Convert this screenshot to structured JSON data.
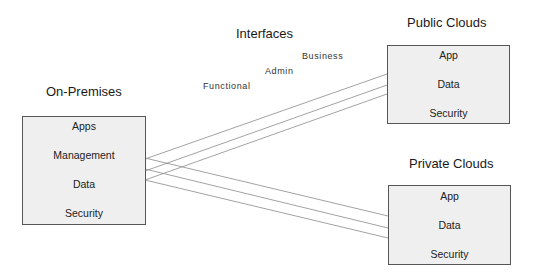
{
  "diagram": {
    "interfaces": {
      "title": "Interfaces",
      "types": [
        "Functional",
        "Admin",
        "Business"
      ]
    },
    "on_premises": {
      "title": "On-Premises",
      "items": [
        "Apps",
        "Management",
        "Data",
        "Security"
      ]
    },
    "public_clouds": {
      "title": "Public Clouds",
      "items": [
        "App",
        "Data",
        "Security"
      ]
    },
    "private_clouds": {
      "title": "Private Clouds",
      "items": [
        "App",
        "Data",
        "Security"
      ]
    },
    "colors": {
      "box_fill": "#efefef",
      "box_border": "#555555",
      "line": "#8a8a8a"
    }
  }
}
